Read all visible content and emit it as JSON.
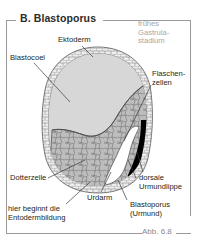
{
  "panel": {
    "title": "B. Blastoporus",
    "caption": "Abb. 6.8"
  },
  "labels": {
    "stage": "frühes\nGastrula-\nstadium",
    "ektoderm": "Ektoderm",
    "blastocoel": "Blastocoel",
    "flaschenzellen": "Flaschen-\nzellen",
    "dotterzelle": "Dotterzelle",
    "urdarm": "Urdarm",
    "dorsale_urmundlippe": "dorsale\nUrmundlippe",
    "blastoporus": "Blastoporus\n(Urmund)",
    "entodermbildung": "hier beginnt die\nEntodermbildung"
  },
  "colors": {
    "frame": "#9a9a9a",
    "text": "#231f20",
    "muted_text": "#a6a6a6",
    "blastocoel_fill": "#d6d6d6",
    "yolk_fill": "#b8b8b8",
    "ectoderm_fill": "#e8e8e8",
    "dorsal_lip": "#000000",
    "blastopore_slit": "#ffffff",
    "outline": "#4a4a4a"
  }
}
